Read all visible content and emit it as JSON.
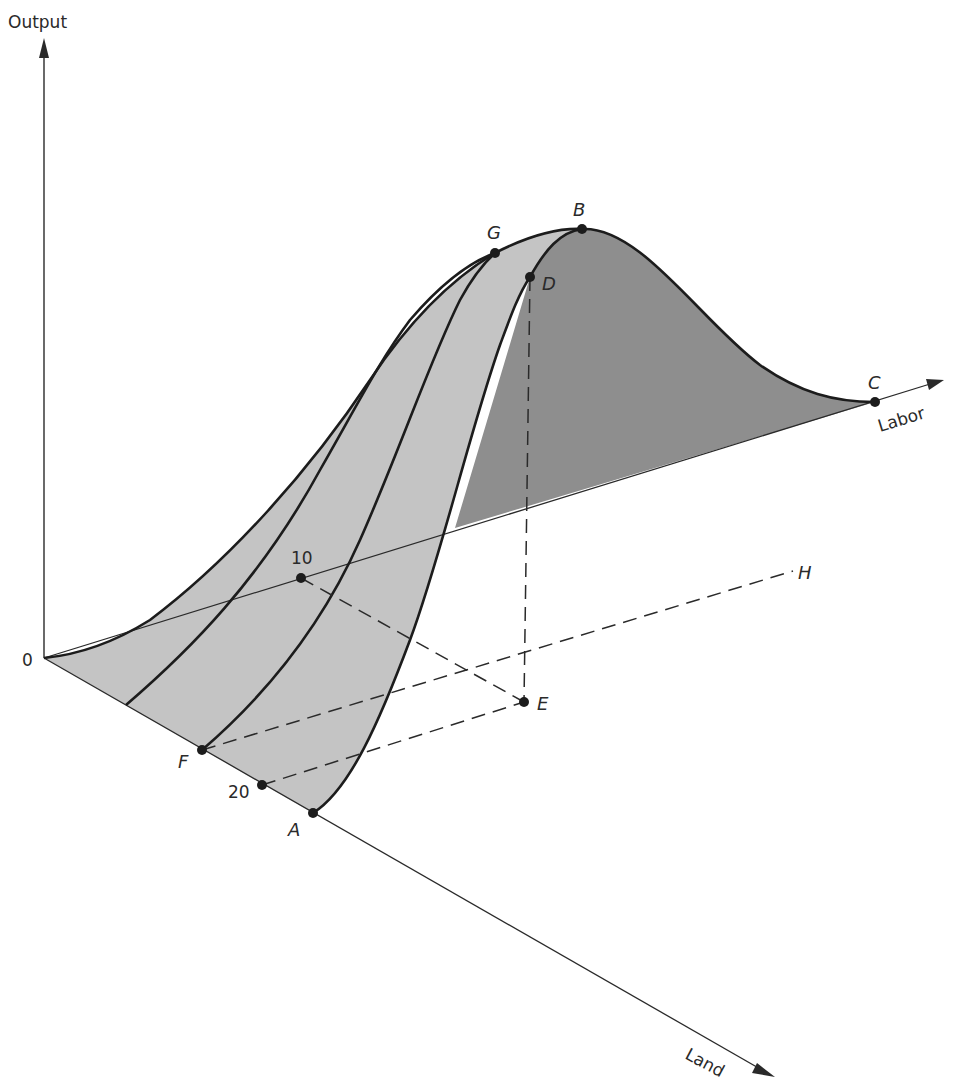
{
  "figure": {
    "type": "3D production surface diagram",
    "axes": {
      "vertical": "Output",
      "right": "Labor",
      "front": "Land",
      "origin": "0"
    },
    "points": {
      "A": "A",
      "B": "B",
      "C": "C",
      "D": "D",
      "E": "E",
      "F": "F",
      "G": "G",
      "H": "H"
    },
    "tick_labels": {
      "labor_10": "10",
      "land_20": "20"
    },
    "colors": {
      "surface_light": "#c4c4c4",
      "surface_dark": "#8e8e8e",
      "lines": "#1c1c1c",
      "background": "#ffffff"
    }
  }
}
